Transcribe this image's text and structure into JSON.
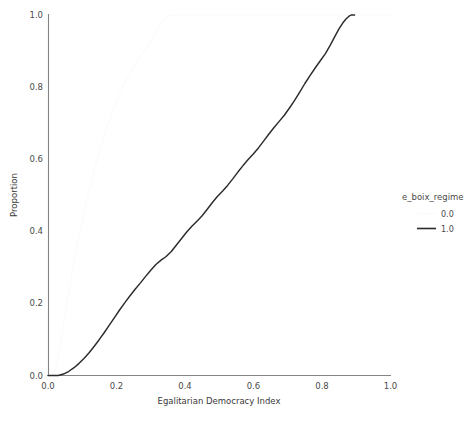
{
  "chart_data": {
    "type": "line",
    "title": "",
    "subtitle": "",
    "xlabel": "Egalitarian Democracy Index",
    "ylabel": "Proportion",
    "xlim": [
      0.0,
      1.0
    ],
    "ylim": [
      0.0,
      1.0
    ],
    "xticks": [
      "0.0",
      "0.2",
      "0.4",
      "0.6",
      "0.8",
      "1.0"
    ],
    "xtick_values": [
      0.0,
      0.2,
      0.4,
      0.6,
      0.8,
      1.0
    ],
    "yticks": [
      "0.0",
      "0.2",
      "0.4",
      "0.6",
      "0.8",
      "1.0"
    ],
    "ytick_values": [
      0.0,
      0.2,
      0.4,
      0.6,
      0.8,
      1.0
    ],
    "grid": false,
    "legend_position": "right",
    "legend_title": "e_boix_regime",
    "series": [
      {
        "name": "0.0",
        "color": "#fbfbfb",
        "width": 1.3,
        "points": [
          [
            0.0,
            0.0
          ],
          [
            0.015,
            0.0
          ],
          [
            0.025,
            0.03
          ],
          [
            0.035,
            0.08
          ],
          [
            0.045,
            0.14
          ],
          [
            0.055,
            0.2
          ],
          [
            0.065,
            0.255
          ],
          [
            0.075,
            0.31
          ],
          [
            0.085,
            0.36
          ],
          [
            0.095,
            0.405
          ],
          [
            0.105,
            0.45
          ],
          [
            0.115,
            0.492
          ],
          [
            0.125,
            0.532
          ],
          [
            0.135,
            0.57
          ],
          [
            0.145,
            0.605
          ],
          [
            0.155,
            0.638
          ],
          [
            0.165,
            0.668
          ],
          [
            0.175,
            0.697
          ],
          [
            0.185,
            0.723
          ],
          [
            0.195,
            0.748
          ],
          [
            0.205,
            0.771
          ],
          [
            0.215,
            0.792
          ],
          [
            0.225,
            0.812
          ],
          [
            0.235,
            0.831
          ],
          [
            0.245,
            0.848
          ],
          [
            0.255,
            0.864
          ],
          [
            0.265,
            0.879
          ],
          [
            0.275,
            0.893
          ],
          [
            0.285,
            0.906
          ],
          [
            0.295,
            0.92
          ],
          [
            0.305,
            0.936
          ],
          [
            0.315,
            0.952
          ],
          [
            0.325,
            0.968
          ],
          [
            0.335,
            0.982
          ],
          [
            0.345,
            0.992
          ],
          [
            0.355,
            0.998
          ],
          [
            0.365,
            1.0
          ],
          [
            0.5,
            1.0
          ],
          [
            0.7,
            1.0
          ],
          [
            1.0,
            1.0
          ]
        ]
      },
      {
        "name": "1.0",
        "color": "#2b2b2b",
        "width": 1.45,
        "points": [
          [
            0.0,
            0.0
          ],
          [
            0.03,
            0.0
          ],
          [
            0.045,
            0.004
          ],
          [
            0.06,
            0.011
          ],
          [
            0.075,
            0.021
          ],
          [
            0.09,
            0.033
          ],
          [
            0.105,
            0.047
          ],
          [
            0.12,
            0.063
          ],
          [
            0.135,
            0.081
          ],
          [
            0.15,
            0.1
          ],
          [
            0.165,
            0.12
          ],
          [
            0.18,
            0.141
          ],
          [
            0.195,
            0.162
          ],
          [
            0.21,
            0.183
          ],
          [
            0.225,
            0.203
          ],
          [
            0.24,
            0.222
          ],
          [
            0.255,
            0.24
          ],
          [
            0.27,
            0.257
          ],
          [
            0.285,
            0.275
          ],
          [
            0.3,
            0.292
          ],
          [
            0.315,
            0.308
          ],
          [
            0.33,
            0.32
          ],
          [
            0.345,
            0.33
          ],
          [
            0.36,
            0.344
          ],
          [
            0.375,
            0.362
          ],
          [
            0.39,
            0.38
          ],
          [
            0.405,
            0.398
          ],
          [
            0.42,
            0.414
          ],
          [
            0.435,
            0.428
          ],
          [
            0.45,
            0.443
          ],
          [
            0.465,
            0.461
          ],
          [
            0.48,
            0.48
          ],
          [
            0.495,
            0.497
          ],
          [
            0.51,
            0.512
          ],
          [
            0.525,
            0.528
          ],
          [
            0.54,
            0.546
          ],
          [
            0.555,
            0.565
          ],
          [
            0.57,
            0.583
          ],
          [
            0.585,
            0.6
          ],
          [
            0.6,
            0.615
          ],
          [
            0.615,
            0.632
          ],
          [
            0.63,
            0.651
          ],
          [
            0.645,
            0.67
          ],
          [
            0.66,
            0.688
          ],
          [
            0.675,
            0.705
          ],
          [
            0.69,
            0.722
          ],
          [
            0.705,
            0.742
          ],
          [
            0.72,
            0.763
          ],
          [
            0.735,
            0.786
          ],
          [
            0.75,
            0.81
          ],
          [
            0.765,
            0.832
          ],
          [
            0.78,
            0.853
          ],
          [
            0.795,
            0.873
          ],
          [
            0.81,
            0.893
          ],
          [
            0.825,
            0.918
          ],
          [
            0.84,
            0.945
          ],
          [
            0.85,
            0.962
          ],
          [
            0.86,
            0.977
          ],
          [
            0.87,
            0.989
          ],
          [
            0.878,
            0.996
          ],
          [
            0.885,
            1.0
          ],
          [
            0.895,
            1.0
          ]
        ]
      }
    ]
  },
  "legend": {
    "title": "e_boix_regime",
    "entries": [
      {
        "label": "0.0",
        "swatch_color": "#fbfbfb"
      },
      {
        "label": "1.0",
        "swatch_color": "#2b2b2b"
      }
    ]
  },
  "axes": {
    "x_title": "Egalitarian Democracy Index",
    "y_title": "Proportion"
  }
}
